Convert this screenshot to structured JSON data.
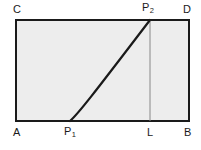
{
  "figure": {
    "kind": "geometry-diagram",
    "caption": "",
    "background_color": "#ffffff",
    "rectangle": {
      "fill_color": "#ededed",
      "stroke_color": "#1a1a1a",
      "stroke_width": 2,
      "left": 16,
      "top": 20,
      "right": 189,
      "bottom": 121,
      "corner_labels": {
        "top_left": "C",
        "top_right": "D",
        "bottom_left": "A",
        "bottom_right": "B"
      }
    },
    "curve": {
      "name": "P1-to-P2-curve",
      "stroke_color": "#1a1a1a",
      "stroke_width": 2.2,
      "shape": "concave-up increasing",
      "start_point": {
        "label": "P",
        "subscript": "1",
        "x": 70,
        "y": 121
      },
      "end_point": {
        "label": "P",
        "subscript": "2",
        "x": 150,
        "y": 20
      },
      "path": "M 70 121 C 78 114, 92 96, 150 20"
    },
    "vertical_segment": {
      "name": "P2-to-L-segment",
      "stroke_color": "#888888",
      "stroke_width": 1,
      "x": 150,
      "top_y": 20,
      "bottom_y": 121,
      "foot_label": "L"
    },
    "labels": {
      "C": "C",
      "D": "D",
      "A": "A",
      "B": "B",
      "L": "L",
      "P1_base": "P",
      "P1_sub": "1",
      "P2_base": "P",
      "P2_sub": "2"
    }
  }
}
